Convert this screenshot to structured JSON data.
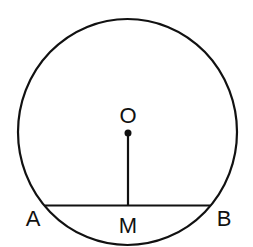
{
  "diagram": {
    "type": "geometry",
    "labels": {
      "center": "O",
      "chord_left": "A",
      "chord_right": "B",
      "midpoint": "M"
    },
    "colors": {
      "stroke": "#111111",
      "background": "#ffffff"
    }
  }
}
